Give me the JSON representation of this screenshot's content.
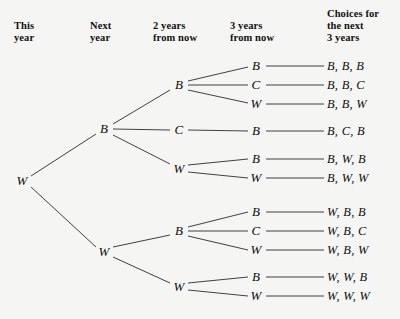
{
  "diagram": {
    "type": "probability-tree",
    "background_color": "#f5f5f4",
    "line_color": "#2b2b2b",
    "text_color": "#0d0d0d",
    "width": 400,
    "height": 319
  },
  "headers": [
    {
      "id": "this-year",
      "text": "This\nyear",
      "x": 14,
      "y": 20
    },
    {
      "id": "next-year",
      "text": "Next\nyear",
      "x": 90,
      "y": 20
    },
    {
      "id": "two-years",
      "text": "2 years\nfrom now",
      "x": 153,
      "y": 20
    },
    {
      "id": "three-years",
      "text": "3 years\nfrom now",
      "x": 230,
      "y": 20
    },
    {
      "id": "choices",
      "text": "Choices for\nthe next\n3 years",
      "x": 327,
      "y": 8
    }
  ],
  "nodes": [
    {
      "id": "n0",
      "label": "W",
      "level": 0,
      "x": 22,
      "y": 181
    },
    {
      "id": "n1",
      "label": "B",
      "level": 1,
      "x": 104,
      "y": 129
    },
    {
      "id": "n2",
      "label": "W",
      "level": 1,
      "x": 104,
      "y": 252
    },
    {
      "id": "n1a",
      "label": "B",
      "level": 2,
      "x": 179,
      "y": 85
    },
    {
      "id": "n1b",
      "label": "C",
      "level": 2,
      "x": 179,
      "y": 130
    },
    {
      "id": "n1c",
      "label": "W",
      "level": 2,
      "x": 179,
      "y": 169
    },
    {
      "id": "n2a",
      "label": "B",
      "level": 2,
      "x": 179,
      "y": 231
    },
    {
      "id": "n2b",
      "label": "W",
      "level": 2,
      "x": 179,
      "y": 287
    },
    {
      "id": "n1a1",
      "label": "B",
      "level": 3,
      "x": 256,
      "y": 66
    },
    {
      "id": "n1a2",
      "label": "C",
      "level": 3,
      "x": 256,
      "y": 85
    },
    {
      "id": "n1a3",
      "label": "W",
      "level": 3,
      "x": 256,
      "y": 104
    },
    {
      "id": "n1b1",
      "label": "B",
      "level": 3,
      "x": 256,
      "y": 131
    },
    {
      "id": "n1c1",
      "label": "B",
      "level": 3,
      "x": 256,
      "y": 159
    },
    {
      "id": "n1c2",
      "label": "W",
      "level": 3,
      "x": 256,
      "y": 178
    },
    {
      "id": "n2a1",
      "label": "B",
      "level": 3,
      "x": 256,
      "y": 212
    },
    {
      "id": "n2a2",
      "label": "C",
      "level": 3,
      "x": 256,
      "y": 231
    },
    {
      "id": "n2a3",
      "label": "W",
      "level": 3,
      "x": 256,
      "y": 250
    },
    {
      "id": "n2b1",
      "label": "B",
      "level": 3,
      "x": 256,
      "y": 277
    },
    {
      "id": "n2b2",
      "label": "W",
      "level": 3,
      "x": 256,
      "y": 296
    }
  ],
  "edges": [
    {
      "from": "n0",
      "to": "n1",
      "x1": 31,
      "y1": 176,
      "x2": 96,
      "y2": 134
    },
    {
      "from": "n0",
      "to": "n2",
      "x1": 31,
      "y1": 187,
      "x2": 96,
      "y2": 247
    },
    {
      "from": "n1",
      "to": "n1a",
      "x1": 113,
      "y1": 124,
      "x2": 170,
      "y2": 90
    },
    {
      "from": "n1",
      "to": "n1b",
      "x1": 113,
      "y1": 129,
      "x2": 170,
      "y2": 130
    },
    {
      "from": "n1",
      "to": "n1c",
      "x1": 113,
      "y1": 135,
      "x2": 170,
      "y2": 164
    },
    {
      "from": "n2",
      "to": "n2a",
      "x1": 113,
      "y1": 247,
      "x2": 170,
      "y2": 235
    },
    {
      "from": "n2",
      "to": "n2b",
      "x1": 113,
      "y1": 257,
      "x2": 170,
      "y2": 283
    },
    {
      "from": "n1a",
      "to": "n1a1",
      "x1": 188,
      "y1": 81,
      "x2": 248,
      "y2": 67
    },
    {
      "from": "n1a",
      "to": "n1a2",
      "x1": 188,
      "y1": 85,
      "x2": 248,
      "y2": 85
    },
    {
      "from": "n1a",
      "to": "n1a3",
      "x1": 188,
      "y1": 90,
      "x2": 248,
      "y2": 103
    },
    {
      "from": "n1b",
      "to": "n1b1",
      "x1": 188,
      "y1": 130,
      "x2": 248,
      "y2": 131
    },
    {
      "from": "n1c",
      "to": "n1c1",
      "x1": 188,
      "y1": 165,
      "x2": 248,
      "y2": 159
    },
    {
      "from": "n1c",
      "to": "n1c2",
      "x1": 188,
      "y1": 172,
      "x2": 248,
      "y2": 178
    },
    {
      "from": "n2a",
      "to": "n2a1",
      "x1": 188,
      "y1": 227,
      "x2": 248,
      "y2": 212
    },
    {
      "from": "n2a",
      "to": "n2a2",
      "x1": 188,
      "y1": 231,
      "x2": 248,
      "y2": 231
    },
    {
      "from": "n2a",
      "to": "n2a3",
      "x1": 188,
      "y1": 236,
      "x2": 248,
      "y2": 250
    },
    {
      "from": "n2b",
      "to": "n2b1",
      "x1": 188,
      "y1": 283,
      "x2": 248,
      "y2": 277
    },
    {
      "from": "n2b",
      "to": "n2b2",
      "x1": 188,
      "y1": 290,
      "x2": 248,
      "y2": 296
    },
    {
      "from": "n1a1",
      "to": "o1",
      "x1": 266,
      "y1": 66,
      "x2": 324,
      "y2": 66
    },
    {
      "from": "n1a2",
      "to": "o2",
      "x1": 266,
      "y1": 85,
      "x2": 324,
      "y2": 85
    },
    {
      "from": "n1a3",
      "to": "o3",
      "x1": 266,
      "y1": 104,
      "x2": 324,
      "y2": 104
    },
    {
      "from": "n1b1",
      "to": "o4",
      "x1": 266,
      "y1": 131,
      "x2": 324,
      "y2": 131
    },
    {
      "from": "n1c1",
      "to": "o5",
      "x1": 266,
      "y1": 159,
      "x2": 324,
      "y2": 159
    },
    {
      "from": "n1c2",
      "to": "o6",
      "x1": 266,
      "y1": 178,
      "x2": 324,
      "y2": 178
    },
    {
      "from": "n2a1",
      "to": "o7",
      "x1": 266,
      "y1": 212,
      "x2": 324,
      "y2": 212
    },
    {
      "from": "n2a2",
      "to": "o8",
      "x1": 266,
      "y1": 231,
      "x2": 324,
      "y2": 231
    },
    {
      "from": "n2a3",
      "to": "o9",
      "x1": 266,
      "y1": 250,
      "x2": 324,
      "y2": 250
    },
    {
      "from": "n2b1",
      "to": "o10",
      "x1": 266,
      "y1": 277,
      "x2": 324,
      "y2": 277
    },
    {
      "from": "n2b2",
      "to": "o11",
      "x1": 266,
      "y1": 296,
      "x2": 324,
      "y2": 296
    }
  ],
  "outcomes": [
    {
      "id": "o1",
      "text": "B, B, B",
      "x": 327,
      "y": 66
    },
    {
      "id": "o2",
      "text": "B, B, C",
      "x": 327,
      "y": 85
    },
    {
      "id": "o3",
      "text": "B, B, W",
      "x": 327,
      "y": 104
    },
    {
      "id": "o4",
      "text": "B, C, B",
      "x": 327,
      "y": 131
    },
    {
      "id": "o5",
      "text": "B, W, B",
      "x": 327,
      "y": 159
    },
    {
      "id": "o6",
      "text": "B, W, W",
      "x": 327,
      "y": 178
    },
    {
      "id": "o7",
      "text": "W, B, B",
      "x": 327,
      "y": 212
    },
    {
      "id": "o8",
      "text": "W, B, C",
      "x": 327,
      "y": 231
    },
    {
      "id": "o9",
      "text": "W, B, W",
      "x": 327,
      "y": 250
    },
    {
      "id": "o10",
      "text": "W, W, B",
      "x": 327,
      "y": 277
    },
    {
      "id": "o11",
      "text": "W, W, W",
      "x": 327,
      "y": 296
    }
  ]
}
